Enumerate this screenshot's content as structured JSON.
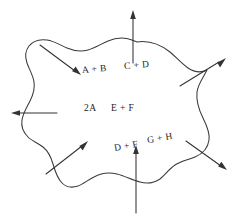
{
  "diagram": {
    "type": "control-volume-reaction-diagram",
    "background_color": "#ffffff",
    "stroke_color": "#333333",
    "text_color": "#242424",
    "boundary": {
      "name": "wavy-closed-boundary",
      "style": "hand-drawn irregular closed curve"
    },
    "labels": {
      "row_top": {
        "left": "A + B",
        "right": "C + D"
      },
      "row_middle": {
        "left": "2A",
        "right": "E + F"
      },
      "row_bottom": {
        "left": "D + F",
        "right": "G + H"
      }
    },
    "arrows": [
      {
        "name": "arrow-top-out",
        "direction": "up",
        "flow": "out"
      },
      {
        "name": "arrow-upper-left-in",
        "direction": "down-right",
        "flow": "in"
      },
      {
        "name": "arrow-upper-right-out",
        "direction": "up-right",
        "flow": "out"
      },
      {
        "name": "arrow-left-out",
        "direction": "left",
        "flow": "out"
      },
      {
        "name": "arrow-lower-left-in",
        "direction": "up-right",
        "flow": "in"
      },
      {
        "name": "arrow-lower-right-out",
        "direction": "down-right",
        "flow": "out"
      },
      {
        "name": "arrow-bottom-in",
        "direction": "up",
        "flow": "in"
      }
    ]
  }
}
